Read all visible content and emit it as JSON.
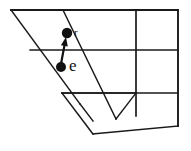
{
  "figure": {
    "kind": "line-drawing",
    "background_color": "#ffffff",
    "ink_color": "#1a1a1a",
    "width": 191,
    "height": 151
  },
  "points": [
    {
      "id": "point-r",
      "label": "r",
      "x": 67,
      "y": 33,
      "radius": 5.2,
      "fill": "#111111"
    },
    {
      "id": "point-e",
      "label": "e",
      "x": 61,
      "y": 67,
      "radius": 5.0,
      "fill": "#111111"
    }
  ],
  "arrow": {
    "id": "arrow-e-to-r",
    "from": {
      "x": 61,
      "y": 64
    },
    "to": {
      "x": 66,
      "y": 37
    },
    "stroke_width": 2.2,
    "head_length": 9,
    "head_width": 7,
    "color": "#111111"
  },
  "geometry": {
    "outline": {
      "id": "plane-outline",
      "points": "11,10 178,10 178,125 93,134 62,93 63,93"
    },
    "strokes": [
      {
        "id": "top-edge",
        "x1": 11,
        "y1": 10,
        "x2": 178,
        "y2": 10,
        "w": 1.9
      },
      {
        "id": "right-edge",
        "x1": 178,
        "y1": 10,
        "x2": 178,
        "y2": 126,
        "w": 1.9
      },
      {
        "id": "bottom-edge",
        "x1": 178,
        "y1": 126,
        "x2": 93,
        "y2": 134,
        "w": 1.6
      },
      {
        "id": "lower-left-edge",
        "x1": 93,
        "y1": 134,
        "x2": 62,
        "y2": 93,
        "w": 1.6
      },
      {
        "id": "inner-band-edge",
        "x1": 62,
        "y1": 93,
        "x2": 136,
        "y2": 93,
        "w": 1.4
      },
      {
        "id": "diagonal-left",
        "x1": 11,
        "y1": 10,
        "x2": 80,
        "y2": 104,
        "w": 1.5
      },
      {
        "id": "diagonal-left-b",
        "x1": 80,
        "y1": 104,
        "x2": 93,
        "y2": 121,
        "w": 1.5
      },
      {
        "id": "diagonal-right",
        "x1": 63,
        "y1": 10,
        "x2": 116,
        "y2": 119,
        "w": 1.4
      },
      {
        "id": "diagonal-notch",
        "x1": 116,
        "y1": 119,
        "x2": 136,
        "y2": 93,
        "w": 1.4
      },
      {
        "id": "gridline-mid",
        "x1": 30,
        "y1": 50,
        "x2": 178,
        "y2": 50,
        "w": 1.3
      },
      {
        "id": "gridline-lower",
        "x1": 62,
        "y1": 93,
        "x2": 178,
        "y2": 93,
        "w": 1.3
      },
      {
        "id": "vertical-rule",
        "x1": 136,
        "y1": 10,
        "x2": 136,
        "y2": 116,
        "w": 1.7
      }
    ]
  }
}
